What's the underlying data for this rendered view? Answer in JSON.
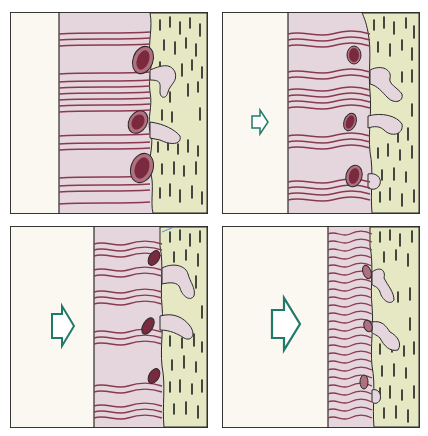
{
  "figure": {
    "colors": {
      "background": "#ffffff",
      "empty_zone": "#fbf8f1",
      "fiber_layer": "#e4d6dc",
      "fiber": "#8a3a4e",
      "cell_fill": "#b07080",
      "cell_nucleus": "#7a2a3e",
      "stipple_layer": "#e6e8c4",
      "stipple_mark": "#1c1c1c",
      "arrow_stroke": "#1f7a6a",
      "border": "#2a2a2a"
    },
    "panels": [
      {
        "id": "panel-1",
        "position": "top-left",
        "arrow": "none",
        "arrow_size": 0
      },
      {
        "id": "panel-2",
        "position": "top-right",
        "arrow": "right-arrow",
        "arrow_size": "small"
      },
      {
        "id": "panel-3",
        "position": "bottom-left",
        "arrow": "right-arrow",
        "arrow_size": "medium"
      },
      {
        "id": "panel-4",
        "position": "bottom-right",
        "arrow": "right-arrow",
        "arrow_size": "large"
      }
    ]
  }
}
